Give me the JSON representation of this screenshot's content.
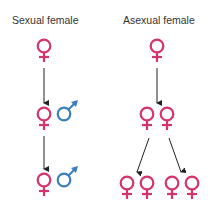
{
  "left_column": {
    "title": "Sexual female",
    "rows": [
      {
        "symbols": [
          "female"
        ]
      },
      {
        "symbols": [
          "female",
          "male"
        ]
      },
      {
        "symbols": [
          "female",
          "male"
        ]
      }
    ]
  },
  "right_column": {
    "title": "Asexual female",
    "rows": [
      {
        "symbols": [
          "female"
        ]
      },
      {
        "symbols": [
          "female",
          "female"
        ]
      },
      {
        "symbols": [
          "female",
          "female",
          "female",
          "female"
        ]
      }
    ]
  },
  "colors": {
    "female": "#d6336c",
    "male": "#3a7fc1",
    "arrow": "#222222",
    "text": "#333333"
  }
}
